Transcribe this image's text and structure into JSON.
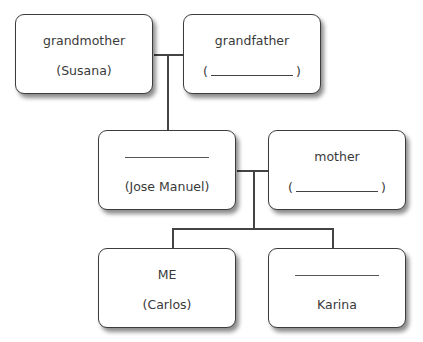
{
  "diagram": {
    "type": "family-tree",
    "nodes": [
      {
        "id": "grandmother",
        "role": "grandmother",
        "name": "(Susana)"
      },
      {
        "id": "grandfather",
        "role": "grandfather",
        "name_blank": true,
        "paren_open": "(",
        "paren_close": ")"
      },
      {
        "id": "father",
        "role_blank": true,
        "name": "(Jose Manuel)"
      },
      {
        "id": "mother",
        "role": "mother",
        "name_blank": true,
        "paren_open": "(",
        "paren_close": ")"
      },
      {
        "id": "me",
        "role": "ME",
        "name": "(Carlos)"
      },
      {
        "id": "sibling",
        "role_blank": true,
        "name": "Karina"
      }
    ],
    "edges": [
      {
        "from": "grandmother+grandfather",
        "to": "father"
      },
      {
        "from": "father+mother",
        "to": "me"
      },
      {
        "from": "father+mother",
        "to": "sibling"
      }
    ]
  },
  "colors": {
    "line": "#444444",
    "box_border": "#3c3c3c",
    "text": "#3a3a3a"
  }
}
